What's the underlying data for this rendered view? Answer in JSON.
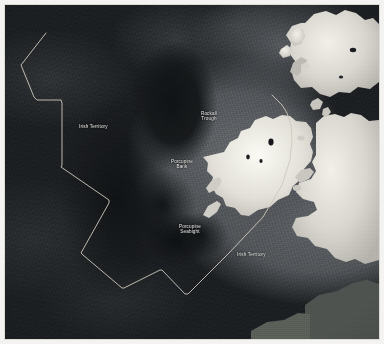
{
  "figure": {
    "type": "satellite-bathymetric-map",
    "region": "North East Atlantic — Ireland, Britain and the Rockall / Porcupine area",
    "palette": {
      "frame": "#ffffff",
      "deep_ocean": "#15181a",
      "abyssal_plain": "#303437",
      "continental_shelf": "#6a6e72",
      "land_bright": "#d8d6cf",
      "land_highlight": "#f0eee7",
      "boundary_line": "#cfcabd",
      "label_text": "#f2f2f0"
    }
  },
  "labels": [
    {
      "id": "irish-territory-northwest",
      "text": "Irish Territory",
      "x": 74,
      "y": 119,
      "align": "left"
    },
    {
      "id": "rockall-trough",
      "text": "Rockall\nTrough",
      "x": 204,
      "y": 109,
      "align": "center"
    },
    {
      "id": "porcupine-bank",
      "text": "Porcupine\nBank",
      "x": 176,
      "y": 157,
      "align": "center"
    },
    {
      "id": "porcupine-seabight",
      "text": "Porcupine\nSeabight",
      "x": 184,
      "y": 222,
      "align": "center"
    },
    {
      "id": "irish-territory-southeast",
      "text": "Irish Territory",
      "x": 237,
      "y": 247,
      "align": "left"
    }
  ],
  "boundary": {
    "name": "Irish Territory claim limit",
    "stroke": "#cfcabd",
    "stroke_width": 0.9,
    "points": "41,28 16,60 29,92 32,95 56,95 57,98 57,160 56,162 104,195 104,198 76,248 78,250 117,283 119,283 155,265 157,265 180,289 183,289 224,248 258,212 277,180 285,155 287,135 286,120 282,108 277,100 267,90"
  },
  "landmasses": [
    {
      "id": "ireland",
      "name": "Ireland"
    },
    {
      "id": "great-britain",
      "name": "Great Britain"
    },
    {
      "id": "scotland",
      "name": "Scotland"
    },
    {
      "id": "outer-hebrides",
      "name": "Outer Hebrides"
    },
    {
      "id": "isle-of-man",
      "name": "Isle of Man"
    },
    {
      "id": "islay-jura",
      "name": "Islay and Jura"
    },
    {
      "id": "anglesey",
      "name": "Anglesey"
    },
    {
      "id": "brittany-coast",
      "name": "Continental coast"
    }
  ],
  "bathymetric_features": [
    {
      "id": "rockall-trough",
      "name": "Rockall Trough",
      "character": "deep trough"
    },
    {
      "id": "porcupine-bank",
      "name": "Porcupine Bank",
      "character": "shallow bank"
    },
    {
      "id": "porcupine-seabight",
      "name": "Porcupine Seabight",
      "character": "deep embayment"
    },
    {
      "id": "continental-shelf",
      "name": "Continental Shelf",
      "character": "shallow shelf"
    },
    {
      "id": "abyssal-plain",
      "name": "Abyssal Plain",
      "character": "deep ocean floor"
    }
  ]
}
